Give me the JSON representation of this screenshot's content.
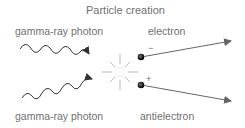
{
  "title": "Particle creation",
  "labels": {
    "photon_top": "gamma-ray photon",
    "photon_bottom": "gamma-ray photon",
    "electron": "electron",
    "antielectron": "antielectron"
  },
  "charges": {
    "electron": "−",
    "antielectron": "+"
  },
  "colors": {
    "text": "#707070",
    "lines": "#555555",
    "arrows": "#666666",
    "particle": "#333333"
  }
}
